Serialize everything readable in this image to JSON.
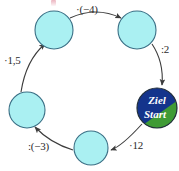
{
  "diagram": {
    "type": "operation-cycle",
    "direction": "counterclockwise",
    "colors": {
      "node_fill": "#aaf0f2",
      "node_stroke": "#3a6f85",
      "ziel_fill": "#14348c",
      "start_fill": "#3f9b35",
      "arrow": "#3c3c3c",
      "label_text": "#2b2b2b",
      "node_label_text": "#ffffff"
    },
    "nodes": [
      {
        "id": "start-ziel",
        "label_top": "Ziel",
        "label_bottom": "Start",
        "kind": "start-goal",
        "cx": 157,
        "cy": 108,
        "r": 20
      },
      {
        "id": "node-bottom",
        "label": "",
        "kind": "empty",
        "cx": 91,
        "cy": 148,
        "r": 17
      },
      {
        "id": "node-left",
        "label": "",
        "kind": "empty",
        "cx": 27,
        "cy": 110,
        "r": 18
      },
      {
        "id": "node-top-left",
        "label": "",
        "kind": "empty",
        "cx": 54,
        "cy": 30,
        "r": 19
      },
      {
        "id": "node-top-right",
        "label": "",
        "kind": "empty",
        "cx": 137,
        "cy": 30,
        "r": 19
      }
    ],
    "edges": [
      {
        "id": "edge-start-to-bottom",
        "from": "start-ziel",
        "to": "node-bottom",
        "label": "·12"
      },
      {
        "id": "edge-bottom-to-left",
        "from": "node-bottom",
        "to": "node-left",
        "label": ":(−3)"
      },
      {
        "id": "edge-left-to-topleft",
        "from": "node-left",
        "to": "node-top-left",
        "label": "·1,5"
      },
      {
        "id": "edge-topleft-to-topright",
        "from": "node-top-left",
        "to": "node-top-right",
        "label": "·(−4)"
      },
      {
        "id": "edge-topright-to-ziel",
        "from": "node-top-right",
        "to": "start-ziel",
        "label": ":2"
      }
    ]
  }
}
